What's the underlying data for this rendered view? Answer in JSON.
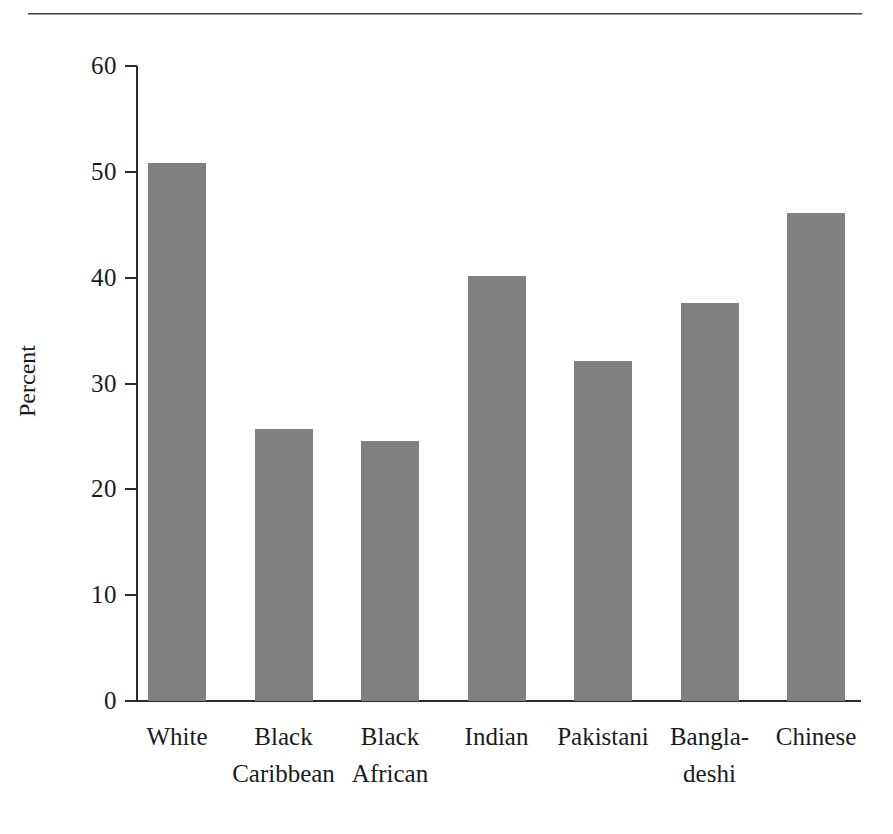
{
  "figure": {
    "top_rule": "horizontal-rule",
    "bar_color": "#808080",
    "axis_color": "#2b2b2b",
    "background": "#ffffff"
  },
  "chart_data": {
    "type": "bar",
    "title": "",
    "xlabel": "",
    "ylabel": "Percent",
    "ylim": [
      0,
      60
    ],
    "yticks": [
      0,
      10,
      20,
      30,
      40,
      50,
      60
    ],
    "ytick_labels": [
      "0",
      "10",
      "20",
      "30",
      "40",
      "50",
      "60"
    ],
    "grid": false,
    "legend": false,
    "categories": [
      "White",
      "Black Caribbean",
      "Black African",
      "Indian",
      "Pakistani",
      "Bangla-deshi",
      "Chinese"
    ],
    "category_label_lines": [
      [
        "White"
      ],
      [
        "Black",
        "Caribbean"
      ],
      [
        "Black",
        "African"
      ],
      [
        "Indian"
      ],
      [
        "Pakistani"
      ],
      [
        "Bangla-",
        "deshi"
      ],
      [
        "Chinese"
      ]
    ],
    "values": [
      50.8,
      25.7,
      24.6,
      40.2,
      32.1,
      37.6,
      46.1
    ],
    "series": [
      {
        "name": "Percent",
        "values": [
          50.8,
          25.7,
          24.6,
          40.2,
          32.1,
          37.6,
          46.1
        ]
      }
    ]
  }
}
